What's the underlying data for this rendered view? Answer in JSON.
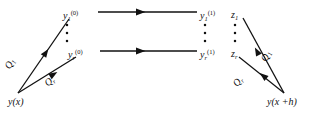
{
  "figure": {
    "type": "commutative-diagram",
    "background_color": "#ffffff",
    "ink_color": "#111111"
  },
  "nodes": {
    "source": {
      "text": "y(x)",
      "x": 8,
      "y": 97
    },
    "target": {
      "text": "y(x +h)",
      "x": 267,
      "y": 97
    },
    "stage_left_first": {
      "base": "y",
      "sub": "1",
      "sup": "(0)",
      "x": 63,
      "y": 13
    },
    "stage_left_last": {
      "base": "y",
      "sub": "r",
      "sup": "(0)",
      "x": 68,
      "y": 52
    },
    "stage_right_first": {
      "base": "y",
      "sub": "1",
      "sup": "(1)",
      "x": 201,
      "y": 13
    },
    "stage_right_last": {
      "base": "y",
      "sub": "r",
      "sup": "(1)",
      "x": 201,
      "y": 52
    },
    "z_first": {
      "base": "z",
      "sub": "1",
      "x": 232,
      "y": 13
    },
    "z_last": {
      "base": "z",
      "sub": "r",
      "x": 232,
      "y": 52
    }
  },
  "edge_labels": {
    "left_q1": {
      "base": "Q",
      "sub": "1"
    },
    "left_qr": {
      "base": "Q",
      "sub": "r"
    },
    "right_q1": {
      "base": "Q",
      "sub": "1"
    },
    "right_qr": {
      "base": "Q",
      "sub": "r"
    }
  },
  "vertical_ellipses": {
    "left_column": {
      "x": 67,
      "dots": 3,
      "y_start": 24,
      "y_step": 8
    },
    "right_column": {
      "x": 205,
      "dots": 3,
      "y_start": 24,
      "y_step": 8
    },
    "z_column": {
      "x": 235,
      "dots": 3,
      "y_start": 24,
      "y_step": 8
    }
  },
  "arrows": {
    "horizontal_top": {
      "from_x": 100,
      "to_x": 198,
      "y": 12
    },
    "horizontal_bottom": {
      "from_x": 100,
      "to_x": 198,
      "y": 51
    },
    "diagonal_source_to_first": {
      "x1": 18,
      "y1": 93,
      "x2": 68,
      "y2": 20
    },
    "diagonal_source_to_last": {
      "x1": 18,
      "y1": 93,
      "x2": 74,
      "y2": 58
    },
    "diagonal_target_to_zfirst": {
      "x1": 284,
      "y1": 93,
      "x2": 243,
      "y2": 20
    },
    "diagonal_target_to_zlast": {
      "x1": 284,
      "y1": 93,
      "x2": 240,
      "y2": 58
    }
  }
}
